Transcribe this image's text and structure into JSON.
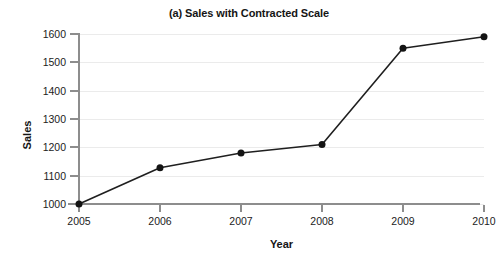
{
  "chart_data": {
    "type": "line",
    "title": "(a) Sales with Contracted Scale",
    "xlabel": "Year",
    "ylabel": "Sales",
    "categories": [
      "2005",
      "2006",
      "2007",
      "2008",
      "2009",
      "2010"
    ],
    "x": [
      2005,
      2006,
      2007,
      2008,
      2009,
      2010
    ],
    "values": [
      1000,
      1128,
      1180,
      1210,
      1550,
      1590
    ],
    "series": [
      {
        "name": "Sales",
        "values": [
          1000,
          1128,
          1180,
          1210,
          1550,
          1590
        ]
      }
    ],
    "ylim": [
      1000,
      1600
    ],
    "xlim": [
      2005,
      2010
    ],
    "y_ticks": [
      1000,
      1100,
      1200,
      1300,
      1400,
      1500,
      1600
    ],
    "y_tick_labels": [
      "1000",
      "1100",
      "1200",
      "1300",
      "1400",
      "1500",
      "1600"
    ],
    "x_ticks": [
      2005,
      2006,
      2007,
      2008,
      2009,
      2010
    ],
    "x_tick_labels": [
      "2005",
      "2006",
      "2007",
      "2008",
      "2009",
      "2010"
    ],
    "grid": true,
    "grid_axis": "y",
    "legend": false,
    "legend_position": "none",
    "marker": "filled-circle",
    "line_color": "#1f1f1f",
    "marker_color": "#141414",
    "grid_color": "#ebebeb",
    "axis_color": "#8d8d8d",
    "background_color": "#ffffff"
  }
}
